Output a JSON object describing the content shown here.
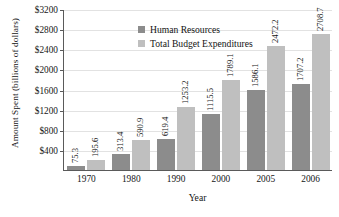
{
  "chart_data": {
    "type": "bar",
    "title": "",
    "xlabel": "Year",
    "ylabel": "Amount Spent (billions of dollars)",
    "categories": [
      "1970",
      "1980",
      "1990",
      "2000",
      "2005",
      "2006"
    ],
    "series": [
      {
        "name": "Human Resources",
        "color": "#8c8c8c",
        "values": [
          75.3,
          313.4,
          619.4,
          1115.5,
          1586.1,
          1707.2
        ]
      },
      {
        "name": "Total Budget Expenditures",
        "color": "#bfbfbf",
        "values": [
          195.6,
          590.9,
          1253.2,
          1789.1,
          2472.2,
          2708.7
        ]
      }
    ],
    "ylim": [
      0,
      3200
    ],
    "ytick_values": [
      400,
      800,
      1200,
      1600,
      2000,
      2400,
      2800,
      3200
    ],
    "ytick_labels": [
      "$400",
      "$800",
      "$1200",
      "$1600",
      "$2000",
      "$2400",
      "$2800",
      "$3200"
    ],
    "grid": true,
    "legend_position": "top-left",
    "bar_labels": [
      [
        "75.3",
        "195.6"
      ],
      [
        "313.4",
        "590.9"
      ],
      [
        "619.4",
        "1253.2"
      ],
      [
        "1115.5",
        "1789.1"
      ],
      [
        "1586.1",
        "2472.2"
      ],
      [
        "1707.2",
        "2708.7"
      ]
    ]
  },
  "legend": {
    "entries": [
      {
        "label": "Human Resources",
        "swatch": "#8c8c8c"
      },
      {
        "label": "Total Budget Expenditures",
        "swatch": "#bfbfbf"
      }
    ]
  }
}
